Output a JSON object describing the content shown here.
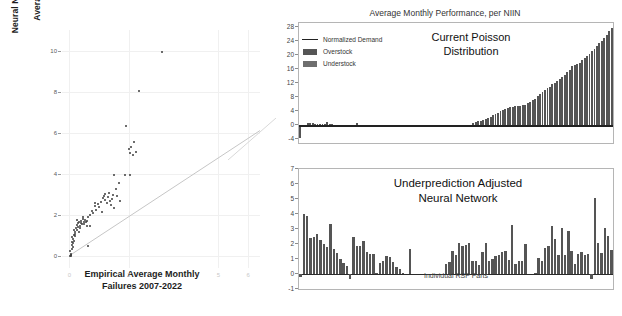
{
  "figure": {
    "background": "#ffffff",
    "bar_color": "#555555",
    "line_color": "#222222",
    "grid_color": "#f0f0f0"
  },
  "scatter": {
    "ylabel": "Neural Network (Cost Adjusted)\nPredicted\nAverage Monthly Failures",
    "xlabel": "Empirical Average Monthly\nFailures 2007-2022",
    "yticks": [
      0,
      2,
      4,
      6,
      8,
      10
    ],
    "xticks": [
      0,
      2,
      5,
      6
    ],
    "xlim": [
      -0.25,
      6.4
    ],
    "ylim": [
      -0.6,
      11.0
    ]
  },
  "chart_data": [
    {
      "id": "scatter-neural-network-vs-empirical",
      "type": "scatter",
      "title": "",
      "xlabel": "Empirical Average Monthly Failures 2007-2022",
      "ylabel": "Neural Network (Cost Adjusted) Predicted Average Monthly Failures",
      "xlim": [
        -0.25,
        6.4
      ],
      "ylim": [
        -0.6,
        11.0
      ],
      "xticks": [
        0,
        2,
        5,
        6
      ],
      "yticks": [
        0,
        2,
        4,
        6,
        8,
        10
      ],
      "grid": true,
      "legend": "none",
      "reference_line": {
        "label": "y = x slope guide",
        "x": [
          0.05,
          6.4
        ],
        "y": [
          0.05,
          6.1
        ]
      },
      "points": [
        [
          0.02,
          0.05
        ],
        [
          0.04,
          0.08
        ],
        [
          0.05,
          0.02
        ],
        [
          0.06,
          0.12
        ],
        [
          0.03,
          0.3
        ],
        [
          0.08,
          0.55
        ],
        [
          0.1,
          0.72
        ],
        [
          0.12,
          0.85
        ],
        [
          0.09,
          0.95
        ],
        [
          0.14,
          0.78
        ],
        [
          0.16,
          1.05
        ],
        [
          0.18,
          1.2
        ],
        [
          0.15,
          1.32
        ],
        [
          0.2,
          1.12
        ],
        [
          0.22,
          1.4
        ],
        [
          0.24,
          1.28
        ],
        [
          0.26,
          1.55
        ],
        [
          0.28,
          1.62
        ],
        [
          0.3,
          1.45
        ],
        [
          0.32,
          1.7
        ],
        [
          0.25,
          1.8
        ],
        [
          0.35,
          1.52
        ],
        [
          0.38,
          1.65
        ],
        [
          0.4,
          1.75
        ],
        [
          0.42,
          1.58
        ],
        [
          0.45,
          1.85
        ],
        [
          0.48,
          1.7
        ],
        [
          0.5,
          1.6
        ],
        [
          0.52,
          1.78
        ],
        [
          0.55,
          1.68
        ],
        [
          0.58,
          1.5
        ],
        [
          0.6,
          1.72
        ],
        [
          0.62,
          0.52
        ],
        [
          0.44,
          1.92
        ],
        [
          0.36,
          1.38
        ],
        [
          0.33,
          1.22
        ],
        [
          0.19,
          1.02
        ],
        [
          0.13,
          0.68
        ],
        [
          0.11,
          0.48
        ],
        [
          0.07,
          0.38
        ],
        [
          0.7,
          2.05
        ],
        [
          0.75,
          2.25
        ],
        [
          0.8,
          2.12
        ],
        [
          0.85,
          2.45
        ],
        [
          0.9,
          2.3
        ],
        [
          0.95,
          2.55
        ],
        [
          1.0,
          2.42
        ],
        [
          1.05,
          2.68
        ],
        [
          1.08,
          2.2
        ],
        [
          1.12,
          2.85
        ],
        [
          1.15,
          2.95
        ],
        [
          1.18,
          3.05
        ],
        [
          1.2,
          2.75
        ],
        [
          1.25,
          2.6
        ],
        [
          1.28,
          2.9
        ],
        [
          1.32,
          3.12
        ],
        [
          1.35,
          2.72
        ],
        [
          1.38,
          2.52
        ],
        [
          1.42,
          2.82
        ],
        [
          1.45,
          3.0
        ],
        [
          1.5,
          2.35
        ],
        [
          1.55,
          3.3
        ],
        [
          1.6,
          2.95
        ],
        [
          1.48,
          4.0
        ],
        [
          1.65,
          3.6
        ],
        [
          1.7,
          2.7
        ],
        [
          1.85,
          4.0
        ],
        [
          1.9,
          6.35
        ],
        [
          2.0,
          5.25
        ],
        [
          2.05,
          5.05
        ],
        [
          2.08,
          5.35
        ],
        [
          2.12,
          4.95
        ],
        [
          2.18,
          5.58
        ],
        [
          2.25,
          5.1
        ],
        [
          2.05,
          3.98
        ],
        [
          2.35,
          8.1
        ],
        [
          3.1,
          10.0
        ],
        [
          0.64,
          1.95
        ],
        [
          0.68,
          1.48
        ],
        [
          0.86,
          2.62
        ]
      ]
    },
    {
      "id": "top-average-monthly-performance",
      "type": "bar",
      "title": "Average Monthly Performance, per NIIN",
      "annotation": "Current Poisson\nDistribution",
      "xlabel": "",
      "ylabel": "",
      "ylim": [
        -5,
        29
      ],
      "yticks": [
        -4,
        0,
        4,
        8,
        12,
        16,
        20,
        24,
        28
      ],
      "xticks": [],
      "grid": false,
      "legend": {
        "position": "upper-left",
        "entries": [
          {
            "label": "Normalized Demand",
            "marker": "line",
            "color": "#222222"
          },
          {
            "label": "Overstock",
            "marker": "bar",
            "color": "#555555"
          },
          {
            "label": "Understock",
            "marker": "bar",
            "color": "#6e6e6e"
          }
        ]
      },
      "values": [
        -3.6,
        -0.6,
        -0.5,
        0.6,
        0.7,
        0.6,
        0.5,
        0.5,
        0.4,
        0.4,
        0.3,
        1.0,
        0.3,
        0.3,
        0.2,
        0.2,
        0.2,
        0.2,
        0.2,
        0.2,
        0.2,
        0.15,
        0.15,
        0.6,
        0.15,
        0.1,
        0.1,
        0.1,
        0.1,
        0.1,
        0.1,
        0.1,
        0.1,
        0.1,
        0.1,
        0.1,
        0.1,
        0.1,
        0.1,
        0.1,
        0.1,
        0.1,
        0.1,
        0.1,
        0.1,
        0.1,
        0.1,
        0.1,
        0.1,
        0.1,
        0.1,
        0.1,
        0.1,
        0.1,
        0.1,
        0.1,
        0.1,
        0.1,
        0.1,
        0.1,
        0.1,
        0.1,
        0.1,
        0.1,
        0.1,
        0.1,
        0.1,
        0.1,
        0.1,
        0.1,
        0.6,
        0.9,
        1.1,
        1.3,
        1.6,
        1.8,
        2.1,
        2.4,
        2.8,
        3.2,
        3.6,
        4.0,
        4.4,
        4.7,
        4.9,
        5.1,
        5.3,
        5.4,
        5.5,
        5.6,
        5.7,
        5.9,
        6.2,
        6.6,
        7.1,
        7.6,
        8.2,
        8.8,
        9.4,
        10.0,
        10.5,
        11.0,
        11.6,
        12.1,
        12.6,
        13.2,
        13.8,
        14.4,
        15.0,
        15.8,
        16.9,
        17.2,
        17.4,
        17.8,
        18.4,
        19.0,
        19.6,
        20.3,
        21.0,
        21.7,
        22.4,
        23.2,
        24.0,
        24.8,
        25.7,
        26.6,
        27.6
      ],
      "demand_line": 0.0
    },
    {
      "id": "bottom-underprediction-adjusted-neural-network",
      "type": "bar",
      "title": "Underprediction Adjusted\nNeural Network",
      "xlabel": "Individual RSP Parts",
      "ylabel": "",
      "ylim": [
        -1,
        7
      ],
      "yticks": [
        -1,
        0,
        1,
        2,
        3,
        4,
        5,
        6,
        7
      ],
      "xticks": [],
      "grid": false,
      "values": [
        -0.2,
        4.0,
        3.9,
        2.4,
        2.5,
        2.7,
        2.3,
        2.0,
        1.8,
        3.35,
        1.7,
        1.4,
        1.0,
        0.75,
        0.55,
        -0.3,
        2.5,
        1.85,
        1.9,
        2.2,
        1.5,
        1.35,
        1.35,
        0.05,
        0.75,
        0.9,
        1.2,
        1.15,
        0.8,
        0.5,
        0.35,
        0.05,
        0.0,
        1.7,
        0.0,
        0.0,
        0.0,
        0.0,
        0.0,
        0.0,
        0.0,
        0.0,
        0.0,
        0.0,
        0.7,
        0.8,
        1.55,
        1.3,
        2.1,
        1.85,
        1.95,
        2.1,
        0.85,
        0.9,
        0.6,
        1.45,
        2.1,
        0.85,
        1.0,
        1.2,
        1.3,
        1.45,
        1.55,
        0.95,
        3.25,
        0.7,
        0.85,
        0.9,
        2.0,
        0.0,
        0.0,
        0.05,
        1.05,
        0.85,
        1.75,
        1.85,
        3.2,
        2.35,
        1.25,
        3.1,
        1.3,
        2.9,
        1.55,
        0.7,
        1.35,
        1.5,
        1.3,
        1.35,
        -0.35,
        5.05,
        2.05,
        1.4,
        3.05,
        2.55,
        1.6
      ]
    }
  ]
}
